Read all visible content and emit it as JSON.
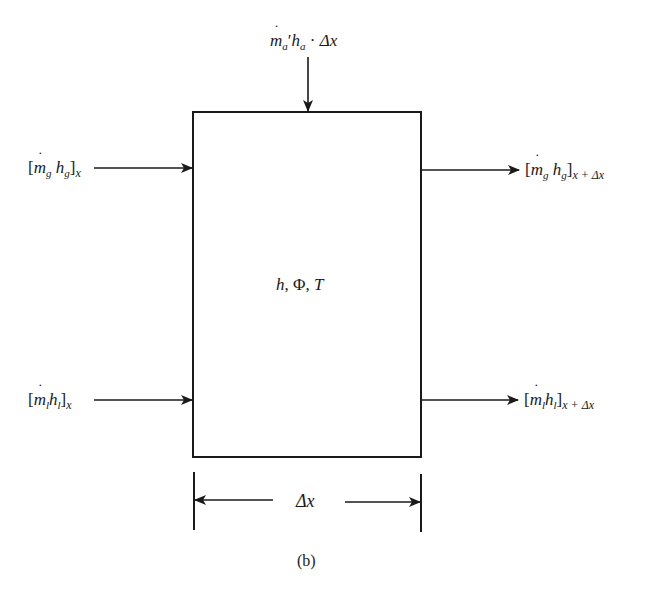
{
  "diagram": {
    "caption": "(b)",
    "control_volume": {
      "label_h": "h",
      "label_phi": "Φ",
      "label_T": "T",
      "sep": ", "
    },
    "top_input": {
      "m": "m",
      "sub_a": "a",
      "prime": "′",
      "h": "h",
      "sub_a2": "a",
      "dot": " · ",
      "dx": "Δx"
    },
    "left_top": {
      "open": "[",
      "m": "m",
      "sub_m": "g",
      "h": "h",
      "sub_h": "g",
      "close": "]",
      "sub_outer": "x"
    },
    "right_top": {
      "open": "[",
      "m": "m",
      "sub_m": "g",
      "h": "h",
      "sub_h": "g",
      "close": "]",
      "sub_outer": "x + Δx"
    },
    "left_bottom": {
      "open": "[",
      "m": "m",
      "sub_m": "l",
      "h": "h",
      "sub_h": "l",
      "close": "]",
      "sub_outer": "x"
    },
    "right_bottom": {
      "open": "[",
      "m": "m",
      "sub_m": "l",
      "h": "h",
      "sub_h": "l",
      "close": "]",
      "sub_outer": "x + Δx"
    },
    "dimension": {
      "label": "Δx"
    },
    "colors": {
      "line": "#1a1a1a",
      "background": "#ffffff"
    }
  }
}
